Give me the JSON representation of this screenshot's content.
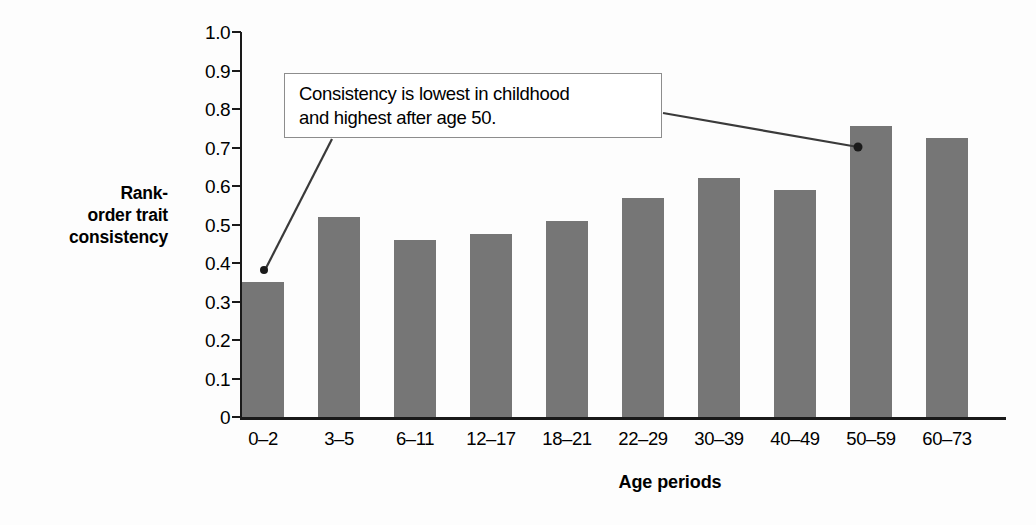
{
  "chart_data": {
    "type": "bar",
    "title": "",
    "subtitle": "",
    "xlabel": "Age periods",
    "ylabel": "Rank-order trait consistency",
    "categories": [
      "0–2",
      "3–5",
      "6–11",
      "12–17",
      "18–21",
      "22–29",
      "30–39",
      "40–49",
      "50–59",
      "60–73"
    ],
    "values": [
      0.35,
      0.52,
      0.46,
      0.475,
      0.51,
      0.57,
      0.62,
      0.59,
      0.755,
      0.725
    ],
    "ylim": [
      0,
      1.0
    ],
    "ytick_values": [
      1.0,
      0.9,
      0.8,
      0.7,
      0.6,
      0.5,
      0.4,
      0.3,
      0.2,
      0.1,
      0
    ],
    "ytick_labels": [
      "1.0",
      "0.9",
      "0.8",
      "0.7",
      "0.6",
      "0.5",
      "0.4",
      "0.3",
      "0.2",
      "0.1",
      "0"
    ],
    "grid": false,
    "legend": null,
    "bar_color": "#767676",
    "axis_color": "#1a1a1a",
    "background_color": "#ffffff",
    "annotations": [
      {
        "text": "Consistency is lowest in childhood\nand highest after age 50.",
        "points_to": [
          "0–2",
          "50–59"
        ]
      }
    ]
  },
  "axes": {
    "y_title_lines": [
      "Rank-",
      "order trait",
      "consistency"
    ],
    "x_title": "Age periods"
  },
  "annotation": {
    "text": "Consistency is lowest in childhood\nand highest after age 50."
  }
}
